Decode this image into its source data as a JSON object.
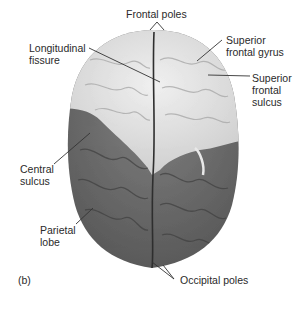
{
  "figure": {
    "panel_label": "(b)",
    "labels": {
      "frontal_poles": "Frontal poles",
      "longitudinal_fissure": "Longitudinal\nfissure",
      "superior_frontal_gyrus": "Superior\nfrontal gyrus",
      "superior_frontal_sulcus": "Superior\nfrontal\nsulcus",
      "central_sulcus": "Central\nsulcus",
      "parietal_lobe": "Parietal\nlobe",
      "occipital_poles": "Occipital poles"
    },
    "colors": {
      "frontal_region": "#e2e2e2",
      "parietal_occipital_region": "#6e6e6e",
      "fissure": "#2e2e2e",
      "leader_line": "#333333"
    }
  }
}
